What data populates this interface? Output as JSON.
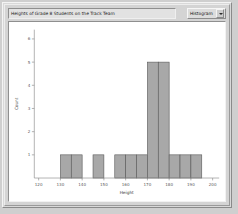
{
  "window": {
    "title_field_value": "Heights of Grade 8 Students on the Track Team",
    "plot_type_selected": "Histogram",
    "plot_type_options": [
      "Histogram",
      "Dot Plot",
      "Box Plot",
      "Scatter Plot"
    ],
    "dropdown_icon": "chevron-down-icon"
  },
  "colors": {
    "bar_fill": "#a8a8a8",
    "bar_stroke": "#555555",
    "axis": "#8d8d8d",
    "plot_background": "#ffffff",
    "window_background": "#d4d4d4"
  },
  "chart_data": {
    "type": "bar",
    "title": "Heights of Grade 8 Students on the Track Team",
    "xlabel": "Height",
    "ylabel": "Count",
    "xlim": [
      118,
      203
    ],
    "ylim": [
      0,
      6.4
    ],
    "grid": false,
    "legend": "none",
    "bin_width": 5,
    "xticks": [
      120,
      130,
      140,
      150,
      160,
      170,
      180,
      190,
      200
    ],
    "xtick_labels": [
      "120",
      "130",
      "140",
      "150",
      "160",
      "170",
      "180",
      "190",
      "200"
    ],
    "yticks": [
      1,
      2,
      3,
      4,
      5,
      6
    ],
    "ytick_labels": [
      "1",
      "2",
      "3",
      "4",
      "5",
      "6"
    ],
    "categories": [
      "130-135",
      "135-140",
      "145-150",
      "155-160",
      "160-165",
      "165-170",
      "170-175",
      "175-180",
      "180-185",
      "185-190",
      "190-195"
    ],
    "bin_starts": [
      130,
      135,
      145,
      155,
      160,
      165,
      170,
      175,
      180,
      185,
      190
    ],
    "values": [
      1,
      1,
      1,
      1,
      1,
      1,
      5,
      5,
      1,
      1,
      1
    ],
    "total_count": 19
  }
}
